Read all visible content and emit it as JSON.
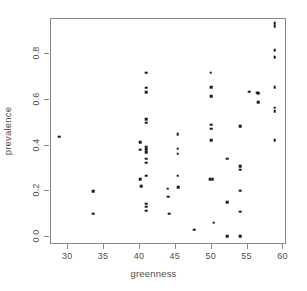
{
  "chart_data": {
    "type": "scatter",
    "title": "",
    "xlabel": "greenness",
    "ylabel": "prevalence",
    "xlim": [
      27.6,
      60.5
    ],
    "ylim": [
      -0.035,
      0.955
    ],
    "grid": false,
    "legend": null,
    "xticks": [
      30,
      35,
      40,
      45,
      50,
      55,
      60
    ],
    "xticklabels": [
      "30",
      "35",
      "40",
      "45",
      "50",
      "55",
      "60"
    ],
    "yticks": [
      0.0,
      0.2,
      0.4,
      0.6,
      0.8
    ],
    "yticklabels": [
      "0.0",
      "0.2",
      "0.4",
      "0.6",
      "0.8"
    ],
    "marker": "filled-square",
    "marker_color": "#1a1a1a",
    "marker_size_px": 2.6,
    "points": [
      [
        28.9,
        0.435
      ],
      [
        33.6,
        0.196
      ],
      [
        33.6,
        0.097
      ],
      [
        40.2,
        0.412
      ],
      [
        40.2,
        0.378
      ],
      [
        40.2,
        0.25
      ],
      [
        40.3,
        0.218
      ],
      [
        41.0,
        0.715
      ],
      [
        41.0,
        0.65
      ],
      [
        41.0,
        0.63
      ],
      [
        41.0,
        0.512
      ],
      [
        41.0,
        0.497
      ],
      [
        41.0,
        0.392
      ],
      [
        41.0,
        0.38
      ],
      [
        41.0,
        0.368
      ],
      [
        41.0,
        0.338
      ],
      [
        41.0,
        0.322
      ],
      [
        41.0,
        0.265
      ],
      [
        41.0,
        0.142
      ],
      [
        41.0,
        0.128
      ],
      [
        41.0,
        0.11
      ],
      [
        44.0,
        0.207
      ],
      [
        44.1,
        0.173
      ],
      [
        44.2,
        0.098
      ],
      [
        45.4,
        0.447
      ],
      [
        45.4,
        0.382
      ],
      [
        45.4,
        0.36
      ],
      [
        45.4,
        0.264
      ],
      [
        45.5,
        0.215
      ],
      [
        47.7,
        0.027
      ],
      [
        50.0,
        0.715
      ],
      [
        50.1,
        0.652
      ],
      [
        50.1,
        0.612
      ],
      [
        50.1,
        0.488
      ],
      [
        50.1,
        0.47
      ],
      [
        50.1,
        0.419
      ],
      [
        49.9,
        0.248
      ],
      [
        50.3,
        0.248
      ],
      [
        50.4,
        0.059
      ],
      [
        52.3,
        0.338
      ],
      [
        52.3,
        0.148
      ],
      [
        52.3,
        0.0
      ],
      [
        54.1,
        0.481
      ],
      [
        54.1,
        0.305
      ],
      [
        54.1,
        0.291
      ],
      [
        54.1,
        0.199
      ],
      [
        54.1,
        0.107
      ],
      [
        54.1,
        0.0
      ],
      [
        55.4,
        0.632
      ],
      [
        56.5,
        0.628
      ],
      [
        56.6,
        0.625
      ],
      [
        56.6,
        0.585
      ],
      [
        58.9,
        0.932
      ],
      [
        58.9,
        0.92
      ],
      [
        58.9,
        0.815
      ],
      [
        58.9,
        0.782
      ],
      [
        58.9,
        0.652
      ],
      [
        58.9,
        0.562
      ],
      [
        58.9,
        0.548
      ],
      [
        58.9,
        0.419
      ]
    ]
  }
}
